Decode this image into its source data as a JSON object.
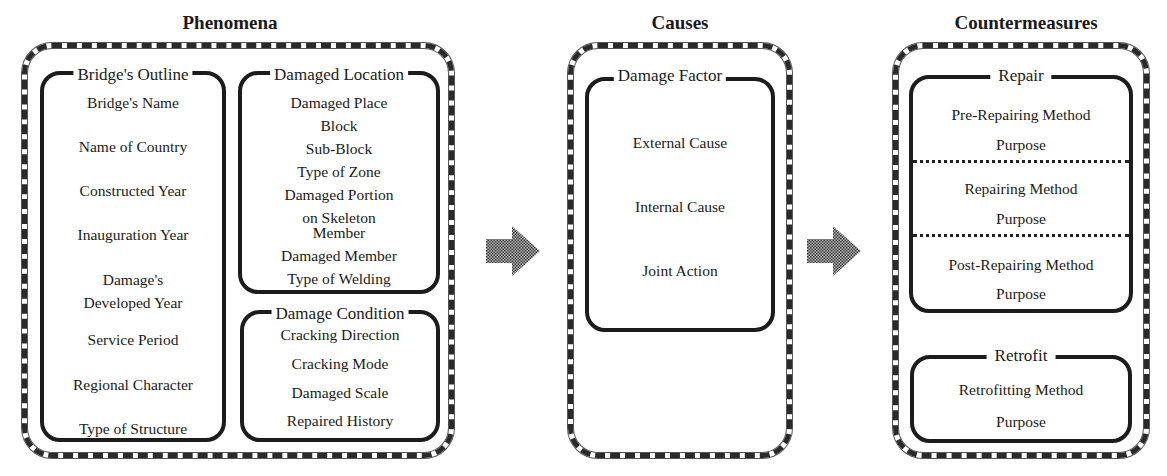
{
  "sections": {
    "phenomena": {
      "title": "Phenomena",
      "groups": {
        "bridges_outline": {
          "label": "Bridge's Outline",
          "items": [
            "Bridge's Name",
            "Name of Country",
            "Constructed Year",
            "Inauguration Year",
            "Damage's",
            "Developed Year",
            "Service Period",
            "Regional Character",
            "Type of Structure"
          ]
        },
        "damaged_location": {
          "label": "Damaged Location",
          "items": [
            "Damaged Place",
            "Block",
            "Sub-Block",
            "Type of Zone",
            "Damaged Portion",
            "on Skeleton",
            "Member",
            "Damaged Member",
            "Type of Welding"
          ]
        },
        "damage_condition": {
          "label": "Damage Condition",
          "items": [
            "Cracking Direction",
            "Cracking Mode",
            "Damaged Scale",
            "Repaired History"
          ]
        }
      }
    },
    "causes": {
      "title": "Causes",
      "groups": {
        "damage_factor": {
          "label": "Damage Factor",
          "items": [
            "External Cause",
            "Internal Cause",
            "Joint Action"
          ]
        }
      }
    },
    "countermeasures": {
      "title": "Countermeasures",
      "groups": {
        "repair": {
          "label": "Repair",
          "items": [
            "Pre-Repairing Method",
            "Purpose",
            "Repairing Method",
            "Purpose",
            "Post-Repairing Method",
            "Purpose"
          ]
        },
        "retrofit": {
          "label": "Retrofit",
          "items": [
            "Retrofitting Method",
            "Purpose"
          ]
        }
      }
    }
  },
  "arrows": [
    "phenomena-to-causes",
    "causes-to-countermeasures"
  ],
  "colors": {
    "line": "#1c1c1c",
    "arrow_fill": "#777777",
    "background": "#ffffff"
  }
}
